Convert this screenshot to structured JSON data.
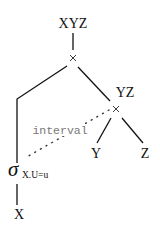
{
  "diagram": {
    "type": "query-plan-tree",
    "nodes": {
      "root": {
        "label": "XYZ",
        "operator": "×"
      },
      "right": {
        "label": "YZ",
        "operator": "×"
      },
      "leaf_y": {
        "label": "Y"
      },
      "leaf_z": {
        "label": "Z"
      },
      "selection": {
        "symbol": "σ",
        "subscript": "X.U=u"
      },
      "leaf_x": {
        "label": "X"
      }
    },
    "edge_annotation": {
      "label": "interval",
      "style": "dotted"
    },
    "colors": {
      "lines": "#111111",
      "annotation_text": "#777777",
      "background": "#ffffff"
    }
  }
}
